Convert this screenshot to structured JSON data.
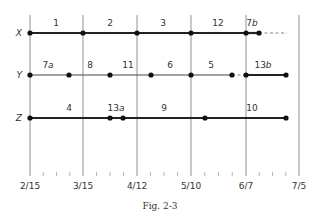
{
  "figure": {
    "caption": "Fig. 2-3",
    "dates": [
      {
        "label": "2/15",
        "x": 30
      },
      {
        "label": "3/15",
        "x": 83
      },
      {
        "label": "4/12",
        "x": 137
      },
      {
        "label": "5/10",
        "x": 191
      },
      {
        "label": "6/7",
        "x": 246
      },
      {
        "label": "7/5",
        "x": 299
      }
    ],
    "minor_ticks_between": 3,
    "rows": [
      {
        "name": "X",
        "y": 33,
        "dots": [
          30,
          83,
          137,
          191,
          246,
          259
        ],
        "segments": [
          {
            "from": 30,
            "to": 246,
            "style": "heavy"
          },
          {
            "from": 246,
            "to": 259,
            "style": "heavy"
          },
          {
            "from": 259,
            "to": 287,
            "style": "dashed"
          }
        ],
        "labels": [
          {
            "text": "1",
            "x": 56
          },
          {
            "text": "2",
            "x": 110
          },
          {
            "text": "3",
            "x": 163
          },
          {
            "text": "12",
            "x": 218
          },
          {
            "text": "7b",
            "x": 252
          }
        ]
      },
      {
        "name": "Y",
        "y": 75,
        "dots": [
          30,
          69,
          110,
          151,
          191,
          232,
          246,
          286
        ],
        "segments": [
          {
            "from": 30,
            "to": 232,
            "style": "thin"
          },
          {
            "from": 232,
            "to": 246,
            "style": "dashed"
          },
          {
            "from": 246,
            "to": 286,
            "style": "heavy"
          }
        ],
        "labels": [
          {
            "text": "7a",
            "x": 48
          },
          {
            "text": "8",
            "x": 90
          },
          {
            "text": "11",
            "x": 128
          },
          {
            "text": "6",
            "x": 170
          },
          {
            "text": "5",
            "x": 211
          },
          {
            "text": "13b",
            "x": 263
          }
        ]
      },
      {
        "name": "Z",
        "y": 118,
        "dots": [
          30,
          110,
          123,
          205,
          286
        ],
        "segments": [
          {
            "from": 30,
            "to": 286,
            "style": "heavy"
          }
        ],
        "labels": [
          {
            "text": "4",
            "x": 69
          },
          {
            "text": "13a",
            "x": 116
          },
          {
            "text": "9",
            "x": 164
          },
          {
            "text": "10",
            "x": 252
          }
        ]
      }
    ]
  }
}
